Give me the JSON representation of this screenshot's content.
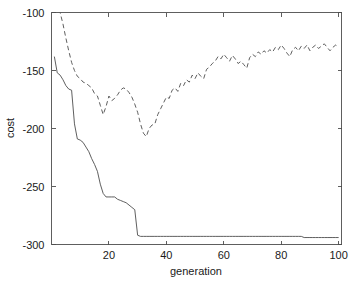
{
  "chart_data": {
    "type": "line",
    "title": "",
    "subtitle": "",
    "xlabel": "generation",
    "ylabel": "cost",
    "xlim": [
      0,
      101
    ],
    "ylim": [
      -300,
      -100
    ],
    "xticks": [
      20,
      40,
      60,
      80,
      100
    ],
    "xtick_labels": [
      "20",
      "40",
      "60",
      "80",
      "100"
    ],
    "yticks": [
      -300,
      -250,
      -200,
      -150,
      -100
    ],
    "ytick_labels": [
      "-300",
      "-250",
      "-200",
      "-150",
      "-100"
    ],
    "grid": false,
    "legend": null,
    "legend_position": "none",
    "annotations": [],
    "box": true,
    "x": [
      1,
      2,
      3,
      4,
      5,
      6,
      7,
      8,
      9,
      10,
      11,
      12,
      13,
      14,
      15,
      16,
      17,
      18,
      19,
      20,
      21,
      22,
      23,
      24,
      25,
      26,
      27,
      28,
      29,
      30,
      31,
      32,
      33,
      34,
      35,
      36,
      37,
      38,
      39,
      40,
      41,
      42,
      43,
      44,
      45,
      46,
      47,
      48,
      49,
      50,
      51,
      52,
      53,
      54,
      55,
      56,
      57,
      58,
      59,
      60,
      61,
      62,
      63,
      64,
      65,
      66,
      67,
      68,
      69,
      70,
      71,
      72,
      73,
      74,
      75,
      76,
      77,
      78,
      79,
      80,
      81,
      82,
      83,
      84,
      85,
      86,
      87,
      88,
      89,
      90,
      91,
      92,
      93,
      94,
      95,
      96,
      97,
      98,
      99,
      100
    ],
    "series": [
      {
        "name": "best cost",
        "style": "solid",
        "color": "#4d4d4d",
        "width": 0.9,
        "values": [
          -138,
          -152,
          -154,
          -158,
          -163,
          -166,
          -167,
          -196,
          -209,
          -210,
          -212,
          -216,
          -220,
          -226,
          -231,
          -237,
          -248,
          -256,
          -259,
          -259,
          -259,
          -259,
          -261,
          -262,
          -263,
          -264,
          -266,
          -268,
          -270,
          -292,
          -293,
          -293,
          -293,
          -293,
          -293,
          -293,
          -293,
          -293,
          -293,
          -293,
          -293,
          -293,
          -293,
          -293,
          -293,
          -293,
          -293,
          -293,
          -293,
          -293,
          -293,
          -293,
          -293,
          -293,
          -293,
          -293,
          -293,
          -293,
          -293,
          -293,
          -293,
          -293,
          -293,
          -293,
          -293,
          -293,
          -293,
          -293,
          -293,
          -293,
          -293,
          -293,
          -293,
          -293,
          -293,
          -293,
          -293,
          -293,
          -293,
          -293,
          -293,
          -293,
          -293,
          -293,
          -293,
          -293,
          -293,
          -294,
          -294,
          -294,
          -294,
          -294,
          -294,
          -294,
          -294,
          -294,
          -294,
          -294,
          -294,
          -294
        ]
      },
      {
        "name": "mean cost",
        "style": "dashed",
        "color": "#4d4d4d",
        "width": 0.9,
        "values": [
          -85,
          -92,
          -100,
          -110,
          -122,
          -133,
          -143,
          -150,
          -155,
          -157,
          -160,
          -161,
          -163,
          -165,
          -170,
          -172,
          -180,
          -188,
          -181,
          -172,
          -176,
          -174,
          -171,
          -167,
          -165,
          -166,
          -169,
          -173,
          -179,
          -186,
          -196,
          -204,
          -207,
          -200,
          -197,
          -196,
          -188,
          -183,
          -178,
          -173,
          -174,
          -167,
          -165,
          -168,
          -161,
          -163,
          -158,
          -160,
          -154,
          -157,
          -152,
          -155,
          -157,
          -149,
          -147,
          -144,
          -142,
          -138,
          -140,
          -136,
          -139,
          -142,
          -137,
          -140,
          -144,
          -142,
          -145,
          -148,
          -139,
          -136,
          -138,
          -134,
          -136,
          -133,
          -135,
          -132,
          -134,
          -130,
          -132,
          -128,
          -131,
          -135,
          -138,
          -132,
          -130,
          -133,
          -129,
          -131,
          -128,
          -133,
          -130,
          -128,
          -131,
          -129,
          -127,
          -130,
          -133,
          -130,
          -128,
          -130
        ]
      }
    ]
  },
  "axes": {
    "xlabel": "generation",
    "ylabel": "cost"
  }
}
